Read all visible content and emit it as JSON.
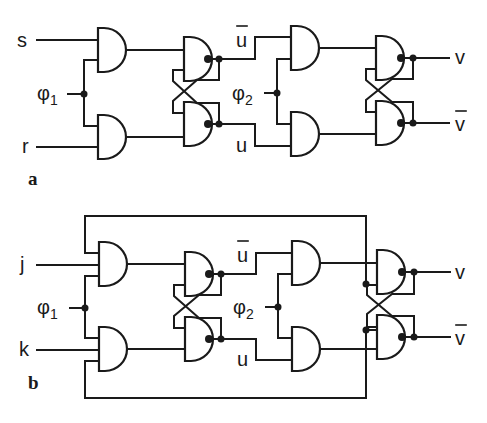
{
  "diagram": {
    "type": "logic circuit (master-slave flip-flops)",
    "colors": {
      "line": "#1a1a1a",
      "background": "#ffffff"
    },
    "panels": [
      {
        "id": "a",
        "label": "a",
        "inputs": {
          "top": "s",
          "bottom": "r"
        },
        "clock1": {
          "symbol": "φ",
          "index": "1"
        },
        "clock2": {
          "symbol": "φ",
          "index": "2"
        },
        "intermediate": {
          "top": "u",
          "top_overbar": true,
          "bottom": "u"
        },
        "outputs": {
          "top": "v",
          "bottom": "v",
          "bottom_overbar": true
        },
        "gates": [
          "AND",
          "AND",
          "NAND",
          "NAND",
          "AND",
          "AND",
          "NAND",
          "NAND"
        ]
      },
      {
        "id": "b",
        "label": "b",
        "inputs": {
          "top": "j",
          "bottom": "k"
        },
        "clock1": {
          "symbol": "φ",
          "index": "1"
        },
        "clock2": {
          "symbol": "φ",
          "index": "2"
        },
        "intermediate": {
          "top": "u",
          "top_overbar": true,
          "bottom": "u"
        },
        "outputs": {
          "top": "v",
          "bottom": "v",
          "bottom_overbar": true
        },
        "feedback": "outer loop from output latch to first-stage AND gates",
        "gates": [
          "AND3",
          "AND3",
          "NAND",
          "NAND",
          "AND",
          "AND",
          "NAND3",
          "NAND3"
        ]
      }
    ]
  }
}
